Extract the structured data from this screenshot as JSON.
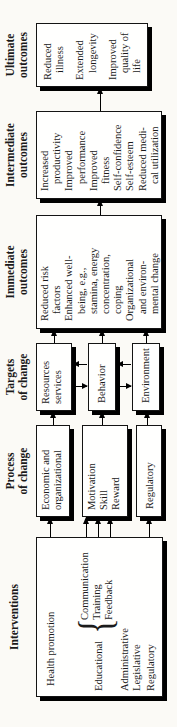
{
  "colors": {
    "ink": "#1b1b1b",
    "paper": "#fbfaf6",
    "box_fill": "#fffffe",
    "shadow": "#000000"
  },
  "headings": {
    "interventions": [
      "Interventions"
    ],
    "process": [
      "Process",
      "of change"
    ],
    "targets": [
      "Targets",
      "of change"
    ],
    "immediate": [
      "Immediate",
      "outcomes"
    ],
    "intermediate": [
      "Intermediate",
      "outcomes"
    ],
    "ultimate": [
      "Ultimate",
      "outcomes"
    ]
  },
  "interventions": {
    "health_promotion": "Health promotion",
    "educational": "Educational",
    "brace": "{",
    "methods": [
      "Communication",
      "Training",
      "Feedback"
    ],
    "administrative": "Administrative",
    "legislative": "Legislative",
    "regulatory": "Regulatory"
  },
  "process": {
    "economic": [
      "Economic and",
      "organizational"
    ],
    "motivation": [
      "Motivation",
      "Skill",
      "Reward"
    ],
    "regulatory": [
      "Regulatory"
    ]
  },
  "targets": {
    "resources": [
      "Resources",
      "services"
    ],
    "behavior": [
      "Behavior"
    ],
    "environment": [
      "Environment"
    ]
  },
  "immediate": {
    "items": [
      [
        "Reduced risk",
        "factors"
      ],
      [
        "Enhanced well-",
        "being, e.g.,",
        "stamina, energy",
        "concentration,",
        "coping"
      ],
      [
        "Organizational",
        "and environ-",
        "mental change"
      ]
    ]
  },
  "intermediate": {
    "items": [
      [
        "Increased",
        "productivity"
      ],
      [
        "Improved",
        "performance"
      ],
      [
        "Improved",
        "fitness"
      ],
      [
        "Self-confidence"
      ],
      [
        "Self-esteem"
      ],
      [
        "Reduced medi-",
        "cal utilization"
      ]
    ]
  },
  "ultimate": {
    "items": [
      [
        "Reduced",
        "illness"
      ],
      [
        "Extended",
        "longevity"
      ],
      [
        "Improved",
        "quality of",
        "life"
      ]
    ]
  }
}
